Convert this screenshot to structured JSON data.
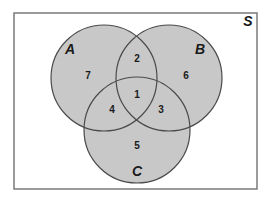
{
  "diagram": {
    "type": "venn",
    "universe": {
      "label": "S"
    },
    "sets": [
      {
        "name": "A",
        "label": "A",
        "cx": 104,
        "cy": 78,
        "r": 53
      },
      {
        "name": "B",
        "label": "B",
        "cx": 169,
        "cy": 78,
        "r": 53
      },
      {
        "name": "C",
        "label": "C",
        "cx": 137,
        "cy": 130,
        "r": 53
      }
    ],
    "regions": [
      {
        "id": "A_only",
        "label": "7",
        "x": 88,
        "y": 78
      },
      {
        "id": "A_and_B_only",
        "label": "2",
        "x": 137,
        "y": 61
      },
      {
        "id": "B_only",
        "label": "6",
        "x": 186,
        "y": 78
      },
      {
        "id": "A_and_B_and_C",
        "label": "1",
        "x": 137,
        "y": 97
      },
      {
        "id": "A_and_C_only",
        "label": "4",
        "x": 112,
        "y": 112
      },
      {
        "id": "B_and_C_only",
        "label": "3",
        "x": 161,
        "y": 112
      },
      {
        "id": "C_only",
        "label": "5",
        "x": 137,
        "y": 148
      }
    ],
    "colors": {
      "fill": "#c8c8c8",
      "stroke": "#4a4a4a",
      "frame": "#7a7a7a",
      "background": "#ffffff"
    }
  }
}
